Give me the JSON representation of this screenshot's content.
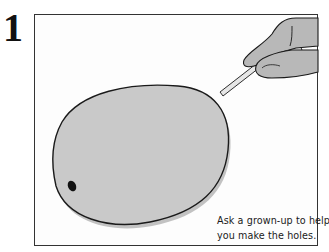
{
  "step": {
    "number": "1"
  },
  "caption": {
    "line1": "Ask a grown-up to help",
    "line2": "you make the holes."
  },
  "illustration": {
    "subject": "egg held with pin by fingers",
    "egg_fill": "#c9c9c9",
    "egg_shadow": "#b3b3b3",
    "outline": "#1a1a1a",
    "hand_fill": "#b8b8b8",
    "pin_fill": "#e6e6e6",
    "hole_fill": "#111111"
  }
}
